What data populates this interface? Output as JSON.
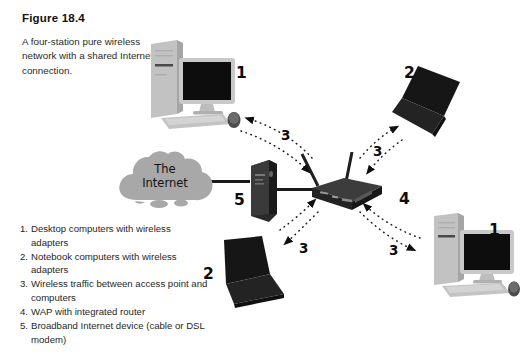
{
  "figure": {
    "title": "Figure 18.4",
    "caption": "A four-station pure wireless network with a shared Internet connection."
  },
  "cloud": {
    "line1": "The",
    "line2": "Internet"
  },
  "legend": [
    {
      "number": "1.",
      "text": "Desktop computers with wireless adapters"
    },
    {
      "number": "2.",
      "text": "Notebook computers with wireless adapters"
    },
    {
      "number": "3.",
      "text": "Wireless traffic between access point and computers"
    },
    {
      "number": "4.",
      "text": "WAP with integrated router"
    },
    {
      "number": "5.",
      "text": "Broadband Internet device (cable or DSL modem)"
    }
  ],
  "callouts": {
    "desktop_top_left": "1",
    "desktop_bottom_right": "1",
    "laptop_top_right": "2",
    "laptop_bottom_left": "2",
    "wireless_top_left": "3",
    "wireless_top_right": "3",
    "wireless_bottom_left": "3",
    "wireless_bottom_right": "3",
    "wap_router": "4",
    "broadband_modem": "5"
  },
  "colors": {
    "cloud_fill": "#a8a8a8",
    "device_dark": "#1c1c1c",
    "device_light": "#c9c9c9",
    "wire": "#1b1b1b",
    "text": "#1a1a1a"
  }
}
